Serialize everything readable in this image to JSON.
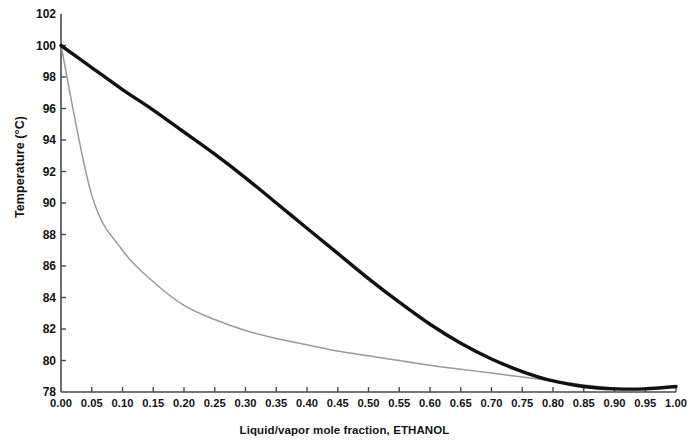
{
  "chart_data": {
    "type": "line",
    "title": "",
    "xlabel": "Liquid/vapor mole fraction, ETHANOL",
    "ylabel": "Temperature (°C)",
    "xlim": [
      0.0,
      1.0
    ],
    "ylim": [
      78,
      102
    ],
    "grid": false,
    "legend": "none",
    "xticks": [
      "0.00",
      "0.05",
      "0.10",
      "0.15",
      "0.20",
      "0.25",
      "0.30",
      "0.35",
      "0.40",
      "0.45",
      "0.50",
      "0.55",
      "0.60",
      "0.65",
      "0.70",
      "0.75",
      "0.80",
      "0.85",
      "0.90",
      "0.95",
      "1.00"
    ],
    "yticks": [
      "78",
      "80",
      "82",
      "84",
      "86",
      "88",
      "90",
      "92",
      "94",
      "96",
      "98",
      "100",
      "102"
    ],
    "x": [
      0.0,
      0.05,
      0.1,
      0.15,
      0.2,
      0.25,
      0.3,
      0.35,
      0.4,
      0.45,
      0.5,
      0.55,
      0.6,
      0.65,
      0.7,
      0.75,
      0.8,
      0.85,
      0.9,
      0.95,
      1.0
    ],
    "series": [
      {
        "name": "Bubble point (liquid)",
        "color": "#111111",
        "width": 3.4,
        "values": [
          100.0,
          98.6,
          97.2,
          95.9,
          94.5,
          93.1,
          91.6,
          90.0,
          88.4,
          86.8,
          85.2,
          83.7,
          82.3,
          81.1,
          80.1,
          79.3,
          78.7,
          78.35,
          78.2,
          78.2,
          78.35
        ]
      },
      {
        "name": "Dew point (vapor)",
        "color": "#9a9a9a",
        "width": 1.5,
        "values": [
          100.0,
          90.5,
          87.0,
          85.0,
          83.5,
          82.6,
          81.9,
          81.4,
          81.0,
          80.6,
          80.3,
          80.0,
          79.7,
          79.45,
          79.2,
          78.95,
          78.7,
          78.45,
          78.25,
          78.2,
          78.35
        ]
      }
    ],
    "annotations": []
  },
  "axis": {
    "y_title": "Temperature (°C)",
    "x_title": "Liquid/vapor mole fraction, ETHANOL"
  }
}
